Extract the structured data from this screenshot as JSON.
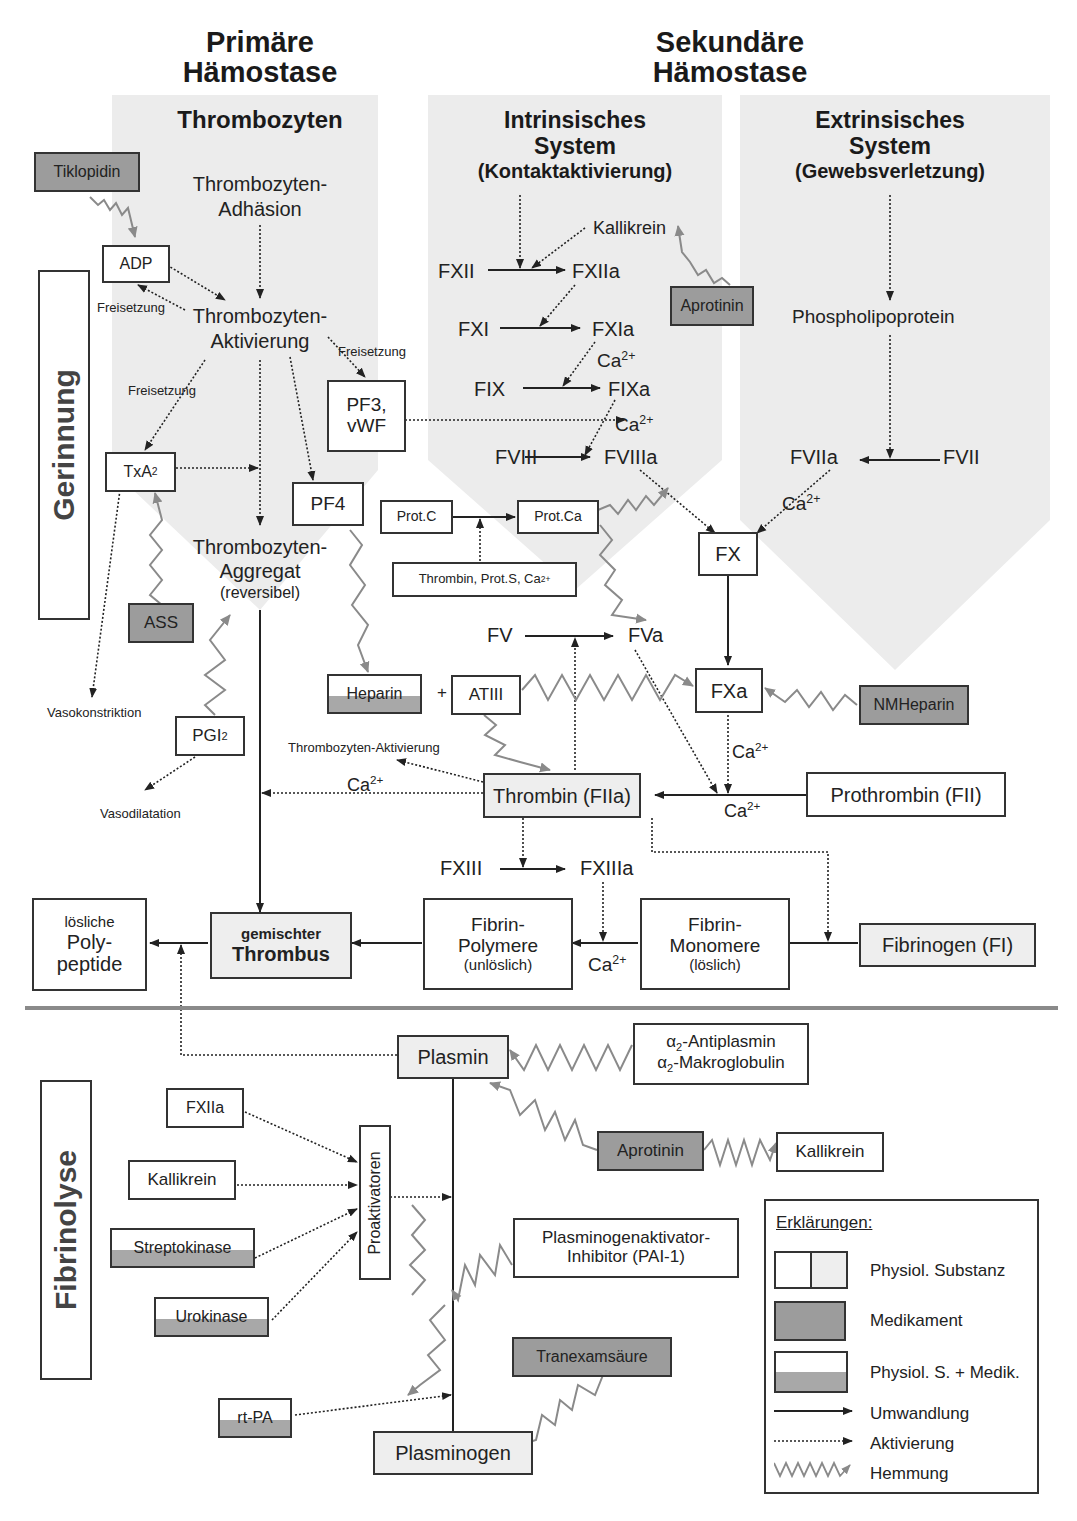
{
  "headings": {
    "primary": "Primäre Hämostase",
    "primary_line1": "Primäre",
    "primary_line2": "Hämostase",
    "secondary_line1": "Sekundäre",
    "secondary_line2": "Hämostase"
  },
  "panels": {
    "thrombozyten": "Thrombozyten",
    "intrinsic_line1": "Intrinsisches",
    "intrinsic_line2": "System",
    "intrinsic_line3": "(Kontaktaktivierung)",
    "extrinsic_line1": "Extrinsisches",
    "extrinsic_line2": "System",
    "extrinsic_line3": "(Gewebsverletzung)"
  },
  "side_labels": {
    "gerinnung": "Gerinnung",
    "fibrinolyse": "Fibrinolyse"
  },
  "primary": {
    "tiklopidin": "Tiklopidin",
    "adhaesion_1": "Thrombozyten-",
    "adhaesion_2": "Adhäsion",
    "adp": "ADP",
    "freisetzung_a": "Freisetzung",
    "aktivierung_1": "Thrombozyten-",
    "aktivierung_2": "Aktivierung",
    "freisetzung_b": "Freisetzung",
    "freisetzung_c": "Freisetzung",
    "pf3_1": "PF3,",
    "pf3_2": "vWF",
    "txa2": "TxA",
    "txa2_sub": "2",
    "pf4": "PF4",
    "aggregat_1": "Thrombozyten-",
    "aggregat_2": "Aggregat",
    "aggregat_3": "(reversibel)",
    "ass": "ASS",
    "vasokonstriktion": "Vasokonstriktion",
    "pgi2": "PGI",
    "pgi2_sub": "2",
    "vasodilatation": "Vasodilatation"
  },
  "intrinsic": {
    "kallikrein": "Kallikrein",
    "fxii": "FXII",
    "fxiia": "FXIIa",
    "aprotinin": "Aprotinin",
    "fxi": "FXI",
    "fxia": "FXIa",
    "ca_1": "Ca",
    "ca_1_sup": "2+",
    "fix": "FIX",
    "fixa": "FIXa",
    "ca_2": "Ca",
    "ca_2_sup": "2+",
    "fviii": "FVIII",
    "fviiia": "FVIIIa"
  },
  "extrinsic": {
    "phospholipoprotein": "Phospholipoprotein",
    "fviia": "FVIIa",
    "fvii": "FVII",
    "ca": "Ca",
    "ca_sup": "2+"
  },
  "common": {
    "prot_c": "Prot.C",
    "prot_ca": "Prot.Ca",
    "cofactors": "Thrombin, Prot.S, Ca",
    "cofactors_sup": "2+",
    "fx": "FX",
    "fv": "FV",
    "fva": "FVa",
    "heparin": "Heparin",
    "plus": "+",
    "atiii": "ATIII",
    "fxa": "FXa",
    "nmheparin": "NMHeparin",
    "ca_fxa": "Ca",
    "ca_fxa_sup": "2+",
    "thrombozyten_aktivierung": "Thrombozyten-Aktivierung",
    "ca_thrombin": "Ca",
    "ca_thrombin_sup": "2+",
    "thrombin": "Thrombin (FIIa)",
    "prothrombin": "Prothrombin (FII)",
    "ca_prothrombin": "Ca",
    "ca_prothrombin_sup": "2+",
    "fxiii": "FXIII",
    "fxiiia": "FXIIIa",
    "loesliche_1": "lösliche",
    "loesliche_2": "Poly-",
    "loesliche_3": "peptide",
    "thrombus_1": "gemischter",
    "thrombus_2": "Thrombus",
    "polymere_1": "Fibrin-",
    "polymere_2": "Polymere",
    "polymere_3": "(unlöslich)",
    "ca_fibrin": "Ca",
    "ca_fibrin_sup": "2+",
    "monomere_1": "Fibrin-",
    "monomere_2": "Monomere",
    "monomere_3": "(löslich)",
    "fibrinogen": "Fibrinogen (FI)"
  },
  "fibrinolysis": {
    "plasmin": "Plasmin",
    "antiplasmin_1": "α",
    "antiplasmin_1_sub": "2",
    "antiplasmin_1_rest": "-Antiplasmin",
    "antiplasmin_2": "α",
    "antiplasmin_2_sub": "2",
    "antiplasmin_2_rest": "-Makroglobulin",
    "fxiia": "FXIIa",
    "aprotinin": "Aprotinin",
    "kallikrein_right": "Kallikrein",
    "kallikrein_left": "Kallikrein",
    "proaktivatoren": "Proaktivatoren",
    "streptokinase": "Streptokinase",
    "pai_1": "Plasminogenaktivator-",
    "pai_2": "Inhibitor (PAI-1)",
    "urokinase": "Urokinase",
    "tranexamsaeure": "Tranexamsäure",
    "rtpa": "rt-PA",
    "plasminogen": "Plasminogen"
  },
  "legend": {
    "title": "Erklärungen:",
    "items": [
      {
        "label": "Physiol. Substanz"
      },
      {
        "label": "Medikament"
      },
      {
        "label": "Physiol. S. + Medik."
      },
      {
        "label": "Umwandlung"
      },
      {
        "label": "Aktivierung"
      },
      {
        "label": "Hemmung"
      }
    ]
  },
  "colors": {
    "panel_bg": "#ececec",
    "drug_fill": "#9c9c9c",
    "inhibition_line": "#8a8a8a",
    "line": "#333333"
  }
}
